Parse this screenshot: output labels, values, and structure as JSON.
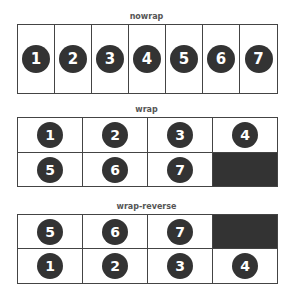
{
  "colors": {
    "border": "#444444",
    "circle": "#333333",
    "filler": "#333333",
    "label": "#555555"
  },
  "sections": [
    {
      "label": "nowrap",
      "items": [
        "1",
        "2",
        "3",
        "4",
        "5",
        "6",
        "7"
      ]
    },
    {
      "label": "wrap",
      "rows": [
        [
          "1",
          "2",
          "3",
          "4"
        ],
        [
          "5",
          "6",
          "7"
        ]
      ]
    },
    {
      "label": "wrap-reverse",
      "rows": [
        [
          "5",
          "6",
          "7"
        ],
        [
          "1",
          "2",
          "3",
          "4"
        ]
      ]
    }
  ]
}
